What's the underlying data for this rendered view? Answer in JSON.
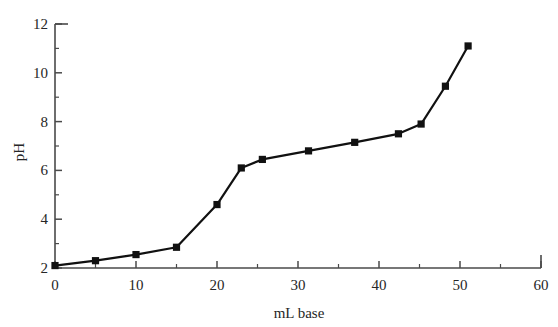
{
  "chart_data": {
    "type": "line",
    "title": "",
    "xlabel": "mL base",
    "ylabel": "pH",
    "xlim": [
      0,
      60
    ],
    "ylim": [
      2,
      12
    ],
    "grid": false,
    "legend": null,
    "xticks": [
      0,
      10,
      20,
      30,
      40,
      50,
      60
    ],
    "xtick_labels": [
      "0",
      "10",
      "20",
      "30",
      "40",
      "50",
      "60"
    ],
    "xminor_ticks": [
      5,
      15,
      25,
      35,
      45,
      55
    ],
    "yticks": [
      2,
      4,
      6,
      8,
      10,
      12
    ],
    "ytick_labels": [
      "2",
      "4",
      "6",
      "8",
      "10",
      "12"
    ],
    "yminor_ticks": [
      3,
      5,
      7,
      9,
      11
    ],
    "marker": "filled-square",
    "line_color": "#111111",
    "marker_color": "#111111",
    "series": [
      {
        "name": "titration",
        "x": [
          0,
          5,
          10,
          15,
          20,
          23,
          25.6,
          31.3,
          37,
          42.4,
          45.2,
          48.2,
          51
        ],
        "y": [
          2.1,
          2.3,
          2.55,
          2.85,
          4.6,
          6.1,
          6.45,
          6.8,
          7.15,
          7.5,
          7.9,
          9.45,
          11.1
        ]
      }
    ]
  },
  "axis": {
    "ylabel": "pH",
    "xlabel": "mL base"
  }
}
